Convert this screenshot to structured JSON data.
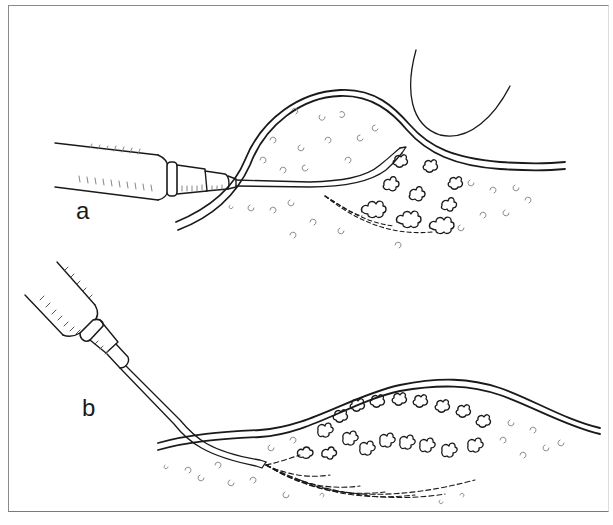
{
  "figure": {
    "type": "medical-illustration",
    "panels": [
      {
        "id": "a",
        "label": "a",
        "description": "Syringe with needle inserted horizontally beneath a skin bulge; dashed tracks fan out to deposits"
      },
      {
        "id": "b",
        "label": "b",
        "description": "Syringe angled downward, needle inserted under skin with multiple dashed tracks fanning into deposits"
      }
    ],
    "colors": {
      "ink": "#1a1a1a",
      "texture": "#9a9a9a",
      "frame": "#8a8a8a",
      "background": "#ffffff"
    }
  }
}
